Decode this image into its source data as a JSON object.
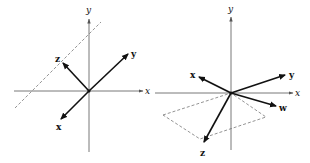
{
  "diagrams": [
    {
      "name": "left",
      "axes": {
        "x": "x",
        "y": "y"
      },
      "vectors": [
        {
          "label": "z"
        },
        {
          "label": "y"
        },
        {
          "label": "x"
        }
      ],
      "dashed": "line"
    },
    {
      "name": "right",
      "axes": {
        "x": "x",
        "y": "y"
      },
      "vectors": [
        {
          "label": "x"
        },
        {
          "label": "y"
        },
        {
          "label": "w"
        },
        {
          "label": "z"
        }
      ],
      "dashed": "parallelogram"
    }
  ],
  "colors": {
    "ink": "#111111",
    "axis": "#555555",
    "dash": "#666666"
  }
}
